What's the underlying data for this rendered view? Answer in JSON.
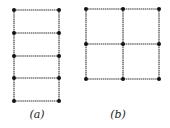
{
  "figures": [
    {
      "id": "a",
      "label": "(a)",
      "label_pos": [
        37,
        108
      ],
      "columns_x": [
        14,
        59
      ],
      "rows_y": [
        10,
        33,
        56,
        78,
        101
      ]
    },
    {
      "id": "b",
      "label": "(b)",
      "label_pos": [
        118,
        108
      ],
      "columns_x": [
        86,
        123,
        159
      ],
      "rows_y": [
        9,
        44,
        79
      ]
    }
  ],
  "style": {
    "line_color": "#333333",
    "node_color": "#111111"
  }
}
